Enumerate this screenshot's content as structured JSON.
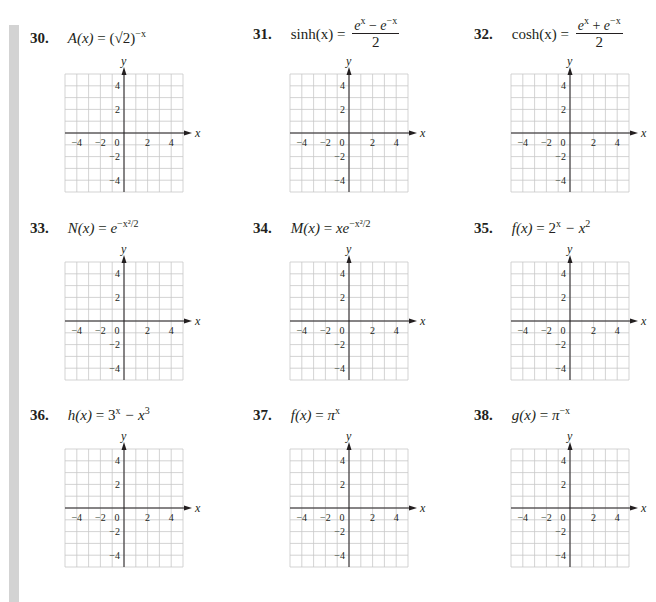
{
  "page": {
    "side_bar_color": "#d3d3d3",
    "grid_color": "#c8c8c8",
    "axis_color": "#231f20"
  },
  "axes": {
    "x_label": "x",
    "y_label": "y",
    "x_ticks": [
      "−4",
      "−2",
      "0",
      "2",
      "4"
    ],
    "y_ticks": [
      "4",
      "2",
      "−2",
      "−4"
    ],
    "range": [
      -5,
      5
    ],
    "grid_step": 1
  },
  "problems": [
    {
      "number": "30.",
      "lhs": "A(x)",
      "rhs_text": "(√2)",
      "rhs_sup": "−x",
      "fraction": null
    },
    {
      "number": "31.",
      "lhs": "sinh(x)",
      "fraction": {
        "numerator": "eˣ − e⁻ˣ",
        "num_a": "e",
        "num_a_sup": "x",
        "op": " − ",
        "num_b": "e",
        "num_b_sup": "−x",
        "denominator": "2"
      }
    },
    {
      "number": "32.",
      "lhs": "cosh(x)",
      "fraction": {
        "numerator": "eˣ + e⁻ˣ",
        "num_a": "e",
        "num_a_sup": "x",
        "op": " + ",
        "num_b": "e",
        "num_b_sup": "−x",
        "denominator": "2"
      }
    },
    {
      "number": "33.",
      "lhs": "N(x)",
      "rhs_text": "e",
      "rhs_sup": "−x²/2",
      "fraction": null
    },
    {
      "number": "34.",
      "lhs": "M(x)",
      "rhs_text": "xe",
      "rhs_sup": "−x²/2",
      "fraction": null
    },
    {
      "number": "35.",
      "lhs": "f(x)",
      "rhs_text": "2",
      "rhs_sup": "x",
      "rhs_tail": " − x",
      "rhs_tail_sup": "2",
      "fraction": null
    },
    {
      "number": "36.",
      "lhs": "h(x)",
      "rhs_text": "3",
      "rhs_sup": "x",
      "rhs_tail": " − x",
      "rhs_tail_sup": "3",
      "fraction": null
    },
    {
      "number": "37.",
      "lhs": "f(x)",
      "rhs_text": "π",
      "rhs_sup": "x",
      "fraction": null
    },
    {
      "number": "38.",
      "lhs": "g(x)",
      "rhs_text": "π",
      "rhs_sup": "−x",
      "fraction": null
    }
  ],
  "chart_data": [
    {
      "type": "line",
      "title": "30. A(x) = (√2)^(−x)",
      "xlabel": "x",
      "ylabel": "y",
      "xlim": [
        -5,
        5
      ],
      "ylim": [
        -5,
        5
      ],
      "x_ticks": [
        -4,
        -2,
        0,
        2,
        4
      ],
      "y_ticks": [
        -4,
        -2,
        2,
        4
      ],
      "grid": true,
      "series": []
    },
    {
      "type": "line",
      "title": "31. sinh(x) = (e^x − e^(−x))/2",
      "xlabel": "x",
      "ylabel": "y",
      "xlim": [
        -5,
        5
      ],
      "ylim": [
        -5,
        5
      ],
      "x_ticks": [
        -4,
        -2,
        0,
        2,
        4
      ],
      "y_ticks": [
        -4,
        -2,
        2,
        4
      ],
      "grid": true,
      "series": []
    },
    {
      "type": "line",
      "title": "32. cosh(x) = (e^x + e^(−x))/2",
      "xlabel": "x",
      "ylabel": "y",
      "xlim": [
        -5,
        5
      ],
      "ylim": [
        -5,
        5
      ],
      "x_ticks": [
        -4,
        -2,
        0,
        2,
        4
      ],
      "y_ticks": [
        -4,
        -2,
        2,
        4
      ],
      "grid": true,
      "series": []
    },
    {
      "type": "line",
      "title": "33. N(x) = e^(−x²/2)",
      "xlabel": "x",
      "ylabel": "y",
      "xlim": [
        -5,
        5
      ],
      "ylim": [
        -5,
        5
      ],
      "x_ticks": [
        -4,
        -2,
        0,
        2,
        4
      ],
      "y_ticks": [
        -4,
        -2,
        2,
        4
      ],
      "grid": true,
      "series": []
    },
    {
      "type": "line",
      "title": "34. M(x) = x e^(−x²/2)",
      "xlabel": "x",
      "ylabel": "y",
      "xlim": [
        -5,
        5
      ],
      "ylim": [
        -5,
        5
      ],
      "x_ticks": [
        -4,
        -2,
        0,
        2,
        4
      ],
      "y_ticks": [
        -4,
        -2,
        2,
        4
      ],
      "grid": true,
      "series": []
    },
    {
      "type": "line",
      "title": "35. f(x) = 2^x − x²",
      "xlabel": "x",
      "ylabel": "y",
      "xlim": [
        -5,
        5
      ],
      "ylim": [
        -5,
        5
      ],
      "x_ticks": [
        -4,
        -2,
        0,
        2,
        4
      ],
      "y_ticks": [
        -4,
        -2,
        2,
        4
      ],
      "grid": true,
      "series": []
    },
    {
      "type": "line",
      "title": "36. h(x) = 3^x − x³",
      "xlabel": "x",
      "ylabel": "y",
      "xlim": [
        -5,
        5
      ],
      "ylim": [
        -5,
        5
      ],
      "x_ticks": [
        -4,
        -2,
        0,
        2,
        4
      ],
      "y_ticks": [
        -4,
        -2,
        2,
        4
      ],
      "grid": true,
      "series": []
    },
    {
      "type": "line",
      "title": "37. f(x) = π^x",
      "xlabel": "x",
      "ylabel": "y",
      "xlim": [
        -5,
        5
      ],
      "ylim": [
        -5,
        5
      ],
      "x_ticks": [
        -4,
        -2,
        0,
        2,
        4
      ],
      "y_ticks": [
        -4,
        -2,
        2,
        4
      ],
      "grid": true,
      "series": []
    },
    {
      "type": "line",
      "title": "38. g(x) = π^(−x)",
      "xlabel": "x",
      "ylabel": "y",
      "xlim": [
        -5,
        5
      ],
      "ylim": [
        -5,
        5
      ],
      "x_ticks": [
        -4,
        -2,
        0,
        2,
        4
      ],
      "y_ticks": [
        -4,
        -2,
        2,
        4
      ],
      "grid": true,
      "series": []
    }
  ]
}
